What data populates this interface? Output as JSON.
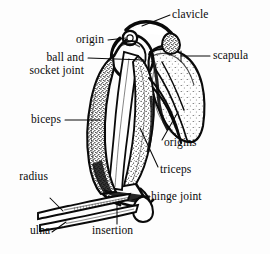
{
  "figure": {
    "background_color": "#fdfdfd",
    "ink_color": "#0a0a0a",
    "width": 270,
    "height": 254
  },
  "labels": {
    "clavicle": "clavicle",
    "scapula": "scapula",
    "origin": "origin",
    "ball_and_socket_line1": "ball and",
    "ball_and_socket_line2": "socket joint",
    "biceps": "biceps",
    "origins": "origins",
    "triceps": "triceps",
    "radius": "radius",
    "ulna": "ulna",
    "hinge_joint": "hinge joint",
    "insertion": "insertion"
  },
  "structures": [
    {
      "name": "clavicle",
      "kind": "bone"
    },
    {
      "name": "scapula",
      "kind": "bone"
    },
    {
      "name": "humerus",
      "kind": "bone"
    },
    {
      "name": "radius",
      "kind": "bone"
    },
    {
      "name": "ulna",
      "kind": "bone"
    },
    {
      "name": "biceps",
      "kind": "muscle"
    },
    {
      "name": "triceps",
      "kind": "muscle"
    },
    {
      "name": "ball and socket joint",
      "kind": "joint"
    },
    {
      "name": "hinge joint",
      "kind": "joint"
    },
    {
      "name": "origin",
      "kind": "attachment"
    },
    {
      "name": "origins",
      "kind": "attachment"
    },
    {
      "name": "insertion",
      "kind": "attachment"
    }
  ]
}
